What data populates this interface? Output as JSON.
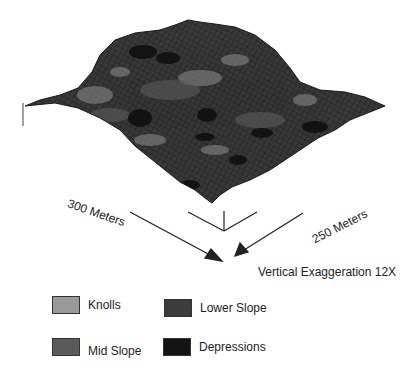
{
  "figure": {
    "dimension_labels": {
      "left": "300 Meters",
      "right": "250 Meters"
    },
    "exaggeration_label": "Vertical Exaggeration 12X"
  },
  "legend": {
    "items": [
      {
        "label": "Knolls",
        "color": "#9a9a9a"
      },
      {
        "label": "Lower Slope",
        "color": "#3c3c3c"
      },
      {
        "label": "Mid Slope",
        "color": "#5a5a5a"
      },
      {
        "label": "Depressions",
        "color": "#141414"
      }
    ]
  },
  "colors": {
    "terrain_base": "#3a3a3a",
    "mesh_line": "#1c1c1c",
    "arrow": "#222222"
  }
}
